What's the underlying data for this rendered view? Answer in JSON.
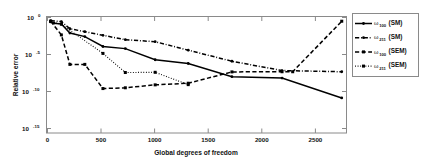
{
  "chart_data": {
    "type": "line",
    "title": "",
    "xlabel": "Global degrees of freedom",
    "ylabel": "Relative error",
    "yscale": "log",
    "xlim": [
      0,
      2800
    ],
    "ylim": [
      1e-18,
      1
    ],
    "grid": false,
    "legend_position": "right-outside",
    "xticks": [
      0,
      500,
      1000,
      1500,
      2000,
      2500
    ],
    "xticklabels": [
      "0",
      "500",
      "1000",
      "1500",
      "2000",
      "2500"
    ],
    "yticks": [
      1,
      1e-05,
      1e-10,
      1e-15
    ],
    "yticklabels": [
      "10^0",
      "10^-5",
      "10^-10",
      "10^-15"
    ],
    "ytick_mantissa": "10",
    "ytick_exponents": [
      "0",
      "-5",
      "-10",
      "-15"
    ],
    "series": [
      {
        "name": "w_100 (SM)",
        "label_base": "ω",
        "label_sub": "100",
        "label_suffix": "(SM)",
        "style": "solid",
        "marker": "dot",
        "x": [
          30,
          60,
          130,
          210,
          350,
          520,
          730,
          1010,
          1320,
          1730,
          2200,
          2760
        ],
        "y": [
          0.2,
          0.12,
          0.09,
          0.003,
          0.0008,
          2e-05,
          9e-06,
          1.4e-07,
          3.5e-08,
          2.5e-10,
          1.5e-10,
          9e-14
        ]
      },
      {
        "name": "w_211 (SM)",
        "label_base": "ω",
        "label_sub": "211",
        "label_suffix": "(SM)",
        "style": "dashdot",
        "marker": "dot",
        "x": [
          30,
          130,
          210,
          350,
          520,
          730,
          1010,
          1320,
          1730,
          2200,
          2760
        ],
        "y": [
          0.3,
          0.22,
          0.015,
          0.005,
          0.0013,
          0.00025,
          0.00012,
          5e-06,
          8e-08,
          2.5e-09,
          1.6e-09
        ]
      },
      {
        "name": "w_100 (SEM)",
        "label_base": "ω",
        "label_sub": "100",
        "label_suffix": "(SEM)",
        "style": "dashed",
        "marker": "square",
        "x": [
          30,
          130,
          210,
          350,
          520,
          730,
          1010,
          1320,
          1730,
          2200,
          2300,
          2760
        ],
        "y": [
          0.25,
          0.0015,
          2.5e-08,
          2.5e-08,
          3e-12,
          4e-12,
          1.2e-11,
          2.2e-11,
          1.5e-09,
          1.6e-09,
          1.6e-09,
          0.25
        ]
      },
      {
        "name": "w_211 (SEM)",
        "label_base": "ω",
        "label_sub": "211",
        "label_suffix": "(SEM)",
        "style": "dotted",
        "marker": "square",
        "x": [
          30,
          130,
          520,
          730,
          1010,
          1320
        ],
        "y": [
          0.22,
          0.08,
          1.5e-06,
          1.2e-09,
          1.3e-09,
          1.3e-11
        ]
      }
    ]
  }
}
